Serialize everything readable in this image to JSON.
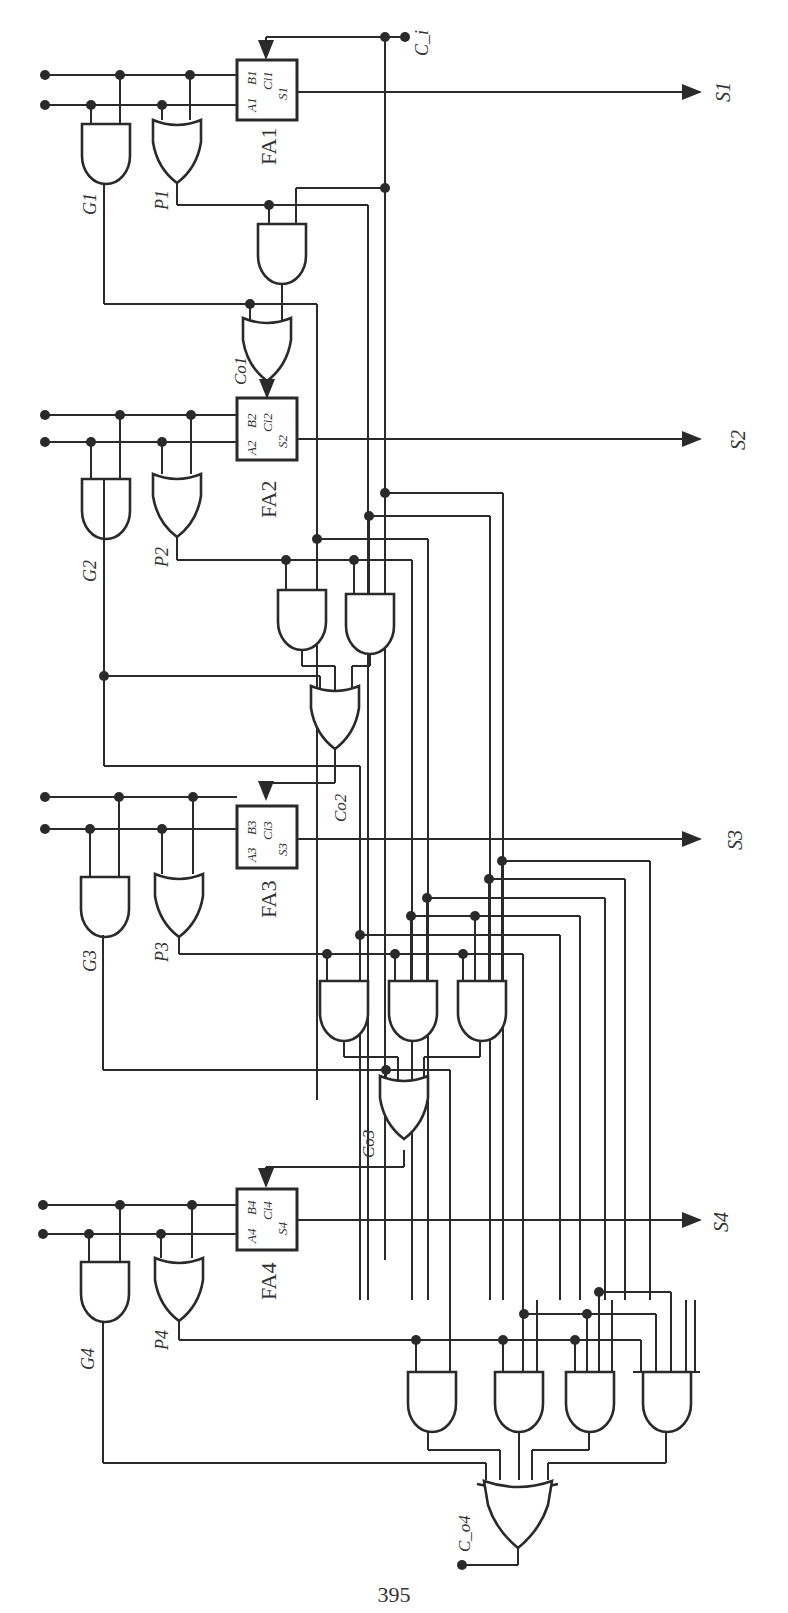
{
  "figure": {
    "page_number": "395",
    "carry_in_label": "C_i",
    "carry_out_label": "C_o4",
    "full_adders": [
      {
        "name": "FA1",
        "pin_a": "A1",
        "pin_b": "B1",
        "pin_c": "Ci1",
        "pin_s": "S1",
        "output": "S1",
        "generate": "G1",
        "propagate": "P1",
        "carry_label": "Co1"
      },
      {
        "name": "FA2",
        "pin_a": "A2",
        "pin_b": "B2",
        "pin_c": "Ci2",
        "pin_s": "S2",
        "output": "S2",
        "generate": "G2",
        "propagate": "P2",
        "carry_label": "Co2"
      },
      {
        "name": "FA3",
        "pin_a": "A3",
        "pin_b": "B3",
        "pin_c": "Ci3",
        "pin_s": "S3",
        "output": "S3",
        "generate": "G3",
        "propagate": "P3",
        "carry_label": "Co3"
      },
      {
        "name": "FA4",
        "pin_a": "A4",
        "pin_b": "B4",
        "pin_c": "Ci4",
        "pin_s": "S4",
        "output": "S4",
        "generate": "G4",
        "propagate": "P4",
        "carry_label": "Co4"
      }
    ],
    "colors": {
      "ink": "#2a2a2a",
      "paper": "#ffffff"
    }
  }
}
